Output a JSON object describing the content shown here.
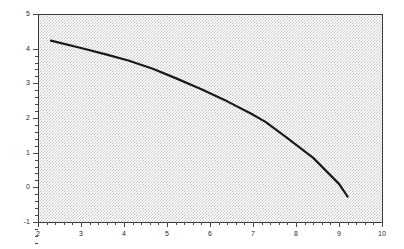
{
  "chart_data": {
    "type": "line",
    "title": "",
    "subtitle": "",
    "xlabel": "",
    "ylabel": "",
    "xlim": [
      2,
      10
    ],
    "ylim": [
      -1,
      5
    ],
    "xticks": [
      2,
      3,
      4,
      5,
      6,
      7,
      8,
      9,
      10
    ],
    "xtick_labels": [
      "2",
      "3",
      "4",
      "5",
      "6",
      "7",
      "8",
      "9",
      "10"
    ],
    "yticks": [
      -1,
      0,
      1,
      2,
      3,
      4,
      5
    ],
    "ytick_labels": [
      "-1",
      "0",
      "1",
      "2",
      "3",
      "4",
      "5"
    ],
    "minor_ticks": true,
    "grid": false,
    "legend": null,
    "annotations": [],
    "plot_background": "#d0d0d0",
    "plot_background_style": "dense-gray-dither-hatch",
    "line_color": "#1a1a1a",
    "line_width": 2.2,
    "series": [
      {
        "name": "curve",
        "x": [
          2.3,
          3.0,
          3.6,
          4.1,
          4.67,
          5.2,
          5.8,
          6.4,
          6.95,
          7.3,
          7.8,
          8.4,
          9.0,
          9.2
        ],
        "y": [
          4.23,
          4.02,
          3.83,
          3.66,
          3.42,
          3.15,
          2.83,
          2.48,
          2.13,
          1.88,
          1.42,
          0.85,
          0.1,
          -0.27
        ]
      }
    ]
  },
  "axes": {
    "y_axis_name": "y-axis",
    "x_axis_name": "x-axis"
  }
}
